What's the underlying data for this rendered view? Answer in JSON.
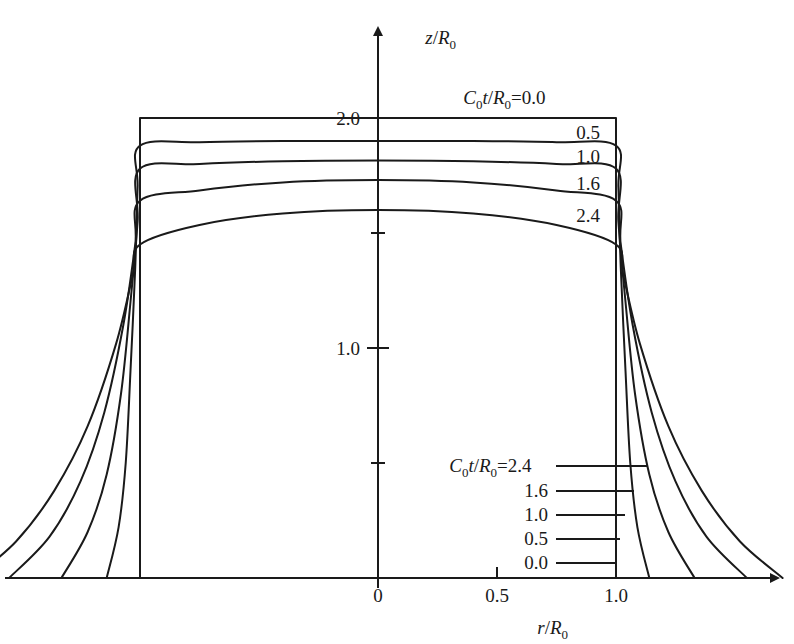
{
  "figure": {
    "title": "",
    "background_color": "#ffffff",
    "line_color": "#1a1a1a",
    "axis_color": "#1a1a1a"
  },
  "axes": {
    "x": {
      "label_parts": {
        "var": "r",
        "slash": "/",
        "base": "R",
        "sub": "0"
      },
      "label_text": "r/R0",
      "ticks": [
        {
          "value": 0,
          "label": "0"
        },
        {
          "value": 0.5,
          "label": "0.5"
        },
        {
          "value": 1.0,
          "label": "1.0"
        }
      ],
      "range": [
        -1.65,
        1.75
      ],
      "arrow": true
    },
    "y": {
      "label_parts": {
        "var": "z",
        "slash": "/",
        "base": "R",
        "sub": "0"
      },
      "label_text": "z/R0",
      "ticks": [
        {
          "value": 0.5,
          "label": ""
        },
        {
          "value": 1.0,
          "label": "1.0"
        },
        {
          "value": 1.5,
          "label": ""
        },
        {
          "value": 2.0,
          "label": "2.0"
        }
      ],
      "range": [
        0,
        2.6
      ],
      "arrow": true
    }
  },
  "legend_top": {
    "head_text": "C0t / R0 =",
    "head_parts": {
      "c": "C",
      "c_sub": "0",
      "t": "t",
      "slash": "/",
      "base": "R",
      "base_sub": "0",
      "eq": "="
    },
    "first_value": "0.0",
    "values": [
      "0.5",
      "1.0",
      "1.6",
      "2.4"
    ]
  },
  "legend_bottom": {
    "head_text": "C0t / R0 =",
    "head_parts": {
      "c": "C",
      "c_sub": "0",
      "t": "t",
      "slash": "/",
      "base": "R",
      "base_sub": "0",
      "eq": "="
    },
    "first_value": "2.4",
    "values": [
      "1.6",
      "1.0",
      "0.5",
      "0.0"
    ]
  },
  "chart_data": {
    "type": "line",
    "title": "",
    "xlabel": "r/R0",
    "ylabel": "z/R0",
    "xlim": [
      -1.65,
      1.75
    ],
    "ylim": [
      0,
      2.6
    ],
    "grid": false,
    "legend_position": "inside-top-right and inside-bottom-right",
    "x_ticks": [
      0,
      0.5,
      1.0
    ],
    "x_tick_labels": [
      "0",
      "0.5",
      "1.0"
    ],
    "y_ticks": [
      0.5,
      1.0,
      1.5,
      2.0
    ],
    "y_tick_labels": [
      "",
      "1.0",
      "",
      "2.0"
    ],
    "series_parameter": "C0t/R0",
    "series": [
      {
        "name": "0.0",
        "label": "C0t/R0 = 0.0",
        "crest_center": 2.0,
        "crest_edge": 2.0,
        "foot_radius": 1.0,
        "points": [
          [
            -1.0,
            0.0
          ],
          [
            -1.0,
            2.0
          ],
          [
            1.0,
            2.0
          ],
          [
            1.0,
            0.0
          ]
        ]
      },
      {
        "name": "0.5",
        "label": "C0t/R0 = 0.5",
        "crest_center": 1.9,
        "crest_edge": 1.88,
        "foot_radius": 1.14,
        "points": [
          [
            -1.14,
            0.0
          ],
          [
            -1.09,
            0.22
          ],
          [
            -1.06,
            0.5
          ],
          [
            -1.04,
            0.9
          ],
          [
            -1.02,
            1.35
          ],
          [
            -1.01,
            1.7
          ],
          [
            -1.0,
            1.88
          ],
          [
            -0.75,
            1.895
          ],
          [
            -0.4,
            1.9
          ],
          [
            0.0,
            1.9
          ],
          [
            0.4,
            1.9
          ],
          [
            0.75,
            1.895
          ],
          [
            1.0,
            1.88
          ],
          [
            1.01,
            1.7
          ],
          [
            1.02,
            1.35
          ],
          [
            1.04,
            0.9
          ],
          [
            1.06,
            0.5
          ],
          [
            1.09,
            0.22
          ],
          [
            1.14,
            0.0
          ]
        ]
      },
      {
        "name": "1.0",
        "label": "C0t/R0 = 1.0",
        "crest_center": 1.815,
        "crest_edge": 1.78,
        "foot_radius": 1.33,
        "points": [
          [
            -1.33,
            0.0
          ],
          [
            -1.22,
            0.2
          ],
          [
            -1.14,
            0.45
          ],
          [
            -1.08,
            0.8
          ],
          [
            -1.04,
            1.2
          ],
          [
            -1.01,
            1.55
          ],
          [
            -1.0,
            1.78
          ],
          [
            -0.75,
            1.8
          ],
          [
            -0.4,
            1.812
          ],
          [
            0.0,
            1.815
          ],
          [
            0.4,
            1.812
          ],
          [
            0.75,
            1.8
          ],
          [
            1.0,
            1.78
          ],
          [
            1.01,
            1.55
          ],
          [
            1.04,
            1.2
          ],
          [
            1.08,
            0.8
          ],
          [
            1.14,
            0.45
          ],
          [
            1.22,
            0.2
          ],
          [
            1.33,
            0.0
          ]
        ]
      },
      {
        "name": "1.6",
        "label": "C0t/R0 = 1.6",
        "crest_center": 1.73,
        "crest_edge": 1.64,
        "foot_radius": 1.55,
        "points": [
          [
            -1.55,
            0.0
          ],
          [
            -1.38,
            0.18
          ],
          [
            -1.25,
            0.42
          ],
          [
            -1.15,
            0.72
          ],
          [
            -1.07,
            1.1
          ],
          [
            -1.02,
            1.45
          ],
          [
            -1.0,
            1.64
          ],
          [
            -0.75,
            1.685
          ],
          [
            -0.4,
            1.72
          ],
          [
            0.0,
            1.73
          ],
          [
            0.4,
            1.72
          ],
          [
            0.75,
            1.685
          ],
          [
            1.0,
            1.64
          ],
          [
            1.02,
            1.45
          ],
          [
            1.07,
            1.1
          ],
          [
            1.15,
            0.72
          ],
          [
            1.25,
            0.42
          ],
          [
            1.38,
            0.18
          ],
          [
            1.55,
            0.0
          ]
        ]
      },
      {
        "name": "2.4",
        "label": "C0t/R0 = 2.4",
        "crest_center": 1.6,
        "crest_edge": 1.45,
        "foot_radius": 1.7,
        "points": [
          [
            -1.7,
            0.0
          ],
          [
            -1.52,
            0.16
          ],
          [
            -1.36,
            0.38
          ],
          [
            -1.22,
            0.66
          ],
          [
            -1.1,
            1.02
          ],
          [
            -1.03,
            1.32
          ],
          [
            -1.0,
            1.45
          ],
          [
            -0.75,
            1.535
          ],
          [
            -0.4,
            1.585
          ],
          [
            0.0,
            1.6
          ],
          [
            0.4,
            1.585
          ],
          [
            0.75,
            1.535
          ],
          [
            1.0,
            1.45
          ],
          [
            1.03,
            1.32
          ],
          [
            1.1,
            1.02
          ],
          [
            1.22,
            0.66
          ],
          [
            1.36,
            0.38
          ],
          [
            1.52,
            0.16
          ],
          [
            1.7,
            0.0
          ]
        ]
      }
    ]
  }
}
